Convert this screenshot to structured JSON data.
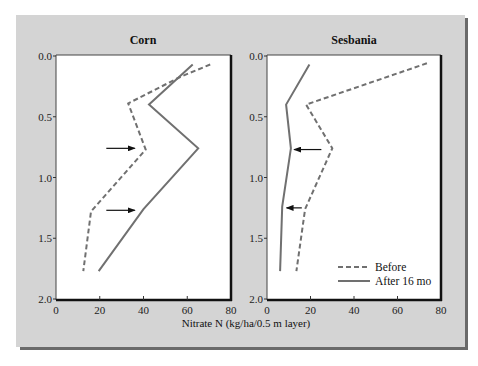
{
  "chart_data": [
    {
      "type": "line",
      "title": "Corn",
      "xlabel": "Nitrate N (kg/ha/0.5 m layer)",
      "ylabel": "",
      "xlim": [
        0,
        80
      ],
      "ylim": [
        2.0,
        0.0
      ],
      "y_inverted": true,
      "xticks": [
        0,
        20,
        40,
        60,
        80
      ],
      "yticks": [
        "0.0",
        "0.5",
        "1.0",
        "1.5",
        "2.0"
      ],
      "grid": false,
      "series": [
        {
          "name": "Before",
          "style": "dashed",
          "points": [
            [
              70.5,
              0.07
            ],
            [
              57,
              0.17
            ],
            [
              33,
              0.39
            ],
            [
              41,
              0.77
            ],
            [
              16,
              1.28
            ],
            [
              12.5,
              1.77
            ]
          ]
        },
        {
          "name": "After 16 mo",
          "style": "solid",
          "points": [
            [
              62.5,
              0.07
            ],
            [
              42.5,
              0.4
            ],
            [
              65,
              0.76
            ],
            [
              40,
              1.26
            ],
            [
              19.5,
              1.77
            ]
          ]
        }
      ],
      "annotations": [
        {
          "type": "arrow",
          "direction": "right",
          "from": [
            23,
            0.76
          ],
          "to": [
            36,
            0.76
          ]
        },
        {
          "type": "arrow",
          "direction": "right",
          "from": [
            23,
            1.27
          ],
          "to": [
            36,
            1.27
          ]
        }
      ]
    },
    {
      "type": "line",
      "title": "Sesbania",
      "xlabel": "Nitrate N (kg/ha/0.5 m layer)",
      "ylabel": "",
      "xlim": [
        0,
        80
      ],
      "ylim": [
        2.0,
        0.0
      ],
      "y_inverted": true,
      "xticks": [
        0,
        20,
        40,
        60,
        80
      ],
      "yticks": [
        "0.0",
        "0.5",
        "1.0",
        "1.5",
        "2.0"
      ],
      "grid": false,
      "series": [
        {
          "name": "Before",
          "style": "dashed",
          "points": [
            [
              73.5,
              0.06
            ],
            [
              18,
              0.4
            ],
            [
              30,
              0.76
            ],
            [
              17.5,
              1.26
            ],
            [
              13.5,
              1.77
            ]
          ]
        },
        {
          "name": "After 16 mo",
          "style": "solid",
          "points": [
            [
              19.5,
              0.07
            ],
            [
              8.8,
              0.4
            ],
            [
              11,
              0.76
            ],
            [
              7,
              1.24
            ],
            [
              6,
              1.77
            ]
          ]
        }
      ],
      "annotations": [
        {
          "type": "arrow",
          "direction": "left",
          "from": [
            25,
            0.77
          ],
          "to": [
            12.5,
            0.77
          ]
        },
        {
          "type": "arrow",
          "direction": "left",
          "from": [
            16,
            1.25
          ],
          "to": [
            9,
            1.25
          ]
        }
      ],
      "legend": {
        "position": "lower right",
        "entries": [
          "Before",
          "After 16 mo"
        ]
      }
    }
  ],
  "panels": [
    {
      "title": "Corn"
    },
    {
      "title": "Sesbania"
    }
  ],
  "xlabel": "Nitrate N (kg/ha/0.5 m layer)",
  "legend": {
    "before": "Before",
    "after": "After 16 mo"
  },
  "colors": {
    "panel_bg": "#d4d4d4",
    "line": "#707070",
    "arrow": "#111111",
    "frame": "#111111"
  }
}
